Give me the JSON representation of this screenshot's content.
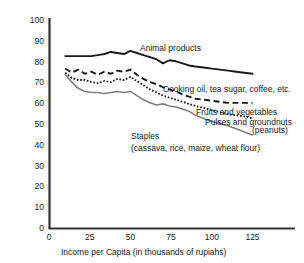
{
  "chart_data": {
    "type": "line",
    "title": "",
    "xlabel": "Income per Capita (in thousands of rupiahs)",
    "ylabel": "",
    "xlim": [
      0,
      130
    ],
    "ylim": [
      0,
      100
    ],
    "xticks": [
      0,
      25,
      50,
      75,
      100,
      125
    ],
    "yticks": [
      0,
      10,
      20,
      30,
      40,
      50,
      60,
      70,
      80,
      90,
      100
    ],
    "grid": false,
    "legend_position": "inline-annotations",
    "x": [
      10,
      14,
      18,
      22,
      26,
      30,
      34,
      38,
      42,
      46,
      50,
      54,
      58,
      62,
      66,
      70,
      74,
      78,
      82,
      86,
      90,
      95,
      100,
      105,
      110,
      115,
      120,
      125
    ],
    "series": [
      {
        "name": "Animal products",
        "style": "solid",
        "color": "#1a1a1a",
        "values": [
          83,
          83,
          83,
          83,
          83,
          83.5,
          84,
          85,
          84.5,
          84,
          85.5,
          84.5,
          83.5,
          82.5,
          81.5,
          79.5,
          81,
          80.5,
          79.5,
          78.5,
          78,
          77.5,
          77,
          76.5,
          76,
          75.5,
          75,
          74.5
        ]
      },
      {
        "name": "Cooking oil, tea sugar, coffee, etc.",
        "style": "dashed",
        "color": "#1a1a1a",
        "values": [
          77,
          75,
          76.5,
          74.5,
          75.5,
          74,
          75.5,
          74.5,
          76,
          75.5,
          76.5,
          74,
          72,
          70.5,
          69.5,
          68,
          67,
          66,
          64.5,
          63.5,
          62.5,
          62,
          61.5,
          61,
          60.5,
          60.5,
          60.5,
          60.5
        ]
      },
      {
        "name": "Fruits and vegetables",
        "style": "dotted",
        "color": "#1a1a1a",
        "values": [
          75,
          72.5,
          71.5,
          71.5,
          70.5,
          70,
          71,
          70.5,
          72,
          71.5,
          73,
          71,
          69,
          67,
          65.5,
          64,
          63,
          62,
          61,
          60,
          59,
          58,
          57,
          56,
          55,
          54.5,
          54,
          53
        ]
      },
      {
        "name": "Pulses and groundnuts (peanuts)",
        "style": "solid",
        "color": "#808080",
        "values": [
          74,
          70.5,
          67.5,
          66,
          65.5,
          65.5,
          65,
          65.5,
          66,
          65.5,
          66,
          64,
          62,
          60.5,
          59.5,
          60,
          59,
          58.5,
          57.5,
          56.5,
          54.5,
          53,
          51.5,
          50.5,
          49.5,
          48,
          46.5,
          45
        ]
      }
    ],
    "annotations": [
      {
        "name": "animal-products",
        "text": "Animal products",
        "x": 140,
        "y": 51
      },
      {
        "name": "cooking-oil",
        "text": "Cooking oil, tea sugar, coffee, etc.",
        "x": 163,
        "y": 92
      },
      {
        "name": "fruits-vegetables",
        "text": "Fruits and vegetables",
        "x": 196,
        "y": 115
      },
      {
        "name": "pulses-groundnuts",
        "text": "Pulses and groundnuts",
        "x": 205,
        "y": 125
      },
      {
        "name": "pulses-groundnuts-peanuts",
        "text": "(peanuts)",
        "x": 252,
        "y": 133
      },
      {
        "name": "staples",
        "text": "Staples",
        "x": 131,
        "y": 139
      },
      {
        "name": "staples-detail",
        "text": "(cassava, rice, maize, wheat flour)",
        "x": 131,
        "y": 151
      }
    ]
  }
}
